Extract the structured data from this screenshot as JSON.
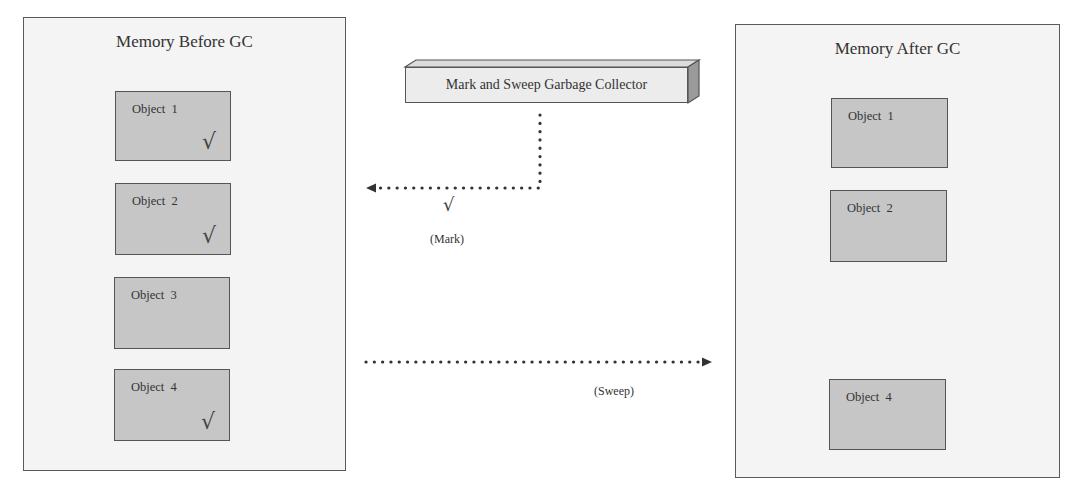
{
  "before": {
    "title": "Memory Before GC",
    "objects": [
      {
        "label": "Object  1",
        "mark": "√"
      },
      {
        "label": "Object  2",
        "mark": "√"
      },
      {
        "label": "Object  3",
        "mark": ""
      },
      {
        "label": "Object  4",
        "mark": "√"
      }
    ]
  },
  "collector": {
    "label": "Mark and Sweep Garbage Collector"
  },
  "mark_phase": {
    "check": "√",
    "label": "(Mark)"
  },
  "sweep_phase": {
    "label": "(Sweep)"
  },
  "after": {
    "title": "Memory After GC",
    "objects": [
      {
        "label": "Object  1"
      },
      {
        "label": "Object  2"
      },
      {
        "label": "Object  4"
      }
    ]
  },
  "colors": {
    "panel_bg": "#f4f4f4",
    "object_fill": "#c6c6c6",
    "line": "#444444"
  }
}
